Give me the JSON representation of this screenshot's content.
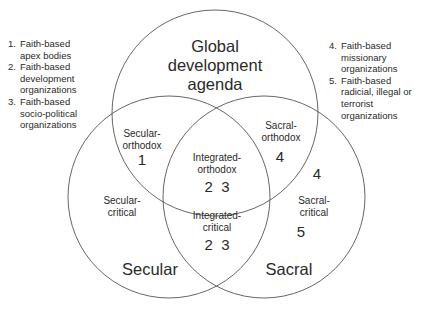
{
  "diagram": {
    "type": "venn",
    "circles": [
      {
        "id": "global",
        "label_lines": [
          "Global",
          "development",
          "agenda"
        ],
        "cx": 215,
        "cy": 113,
        "r": 103
      },
      {
        "id": "secular",
        "label": "Secular",
        "cx": 169,
        "cy": 197,
        "r": 101
      },
      {
        "id": "sacral",
        "label": "Sacral",
        "cx": 264,
        "cy": 197,
        "r": 101
      }
    ],
    "stroke_color": "#555555",
    "regions": {
      "secular_orthodox": {
        "line1": "Secular-",
        "line2": "orthodox",
        "numbers": "1"
      },
      "sacral_orthodox": {
        "line1": "Sacral-",
        "line2": "orthodox",
        "numbers": "4"
      },
      "integrated_orthodox": {
        "line1": "Integrated-",
        "line2": "orthodox",
        "numbers": "2  3"
      },
      "secular_critical": {
        "line1": "Secular-",
        "line2": "critical"
      },
      "integrated_critical": {
        "line1": "Integrated-",
        "line2": "critical",
        "numbers": "2  3"
      },
      "sacral_critical": {
        "line1": "Sacral-",
        "line2": "critical",
        "numbers_above": "4",
        "numbers": "5"
      }
    }
  },
  "legend_left": [
    {
      "num": "1.",
      "lines": [
        "Faith-based",
        "apex bodies"
      ]
    },
    {
      "num": "2.",
      "lines": [
        "Faith-based",
        "development",
        "organizations"
      ]
    },
    {
      "num": "3.",
      "lines": [
        "Faith-based",
        "socio-political",
        "organizations"
      ]
    }
  ],
  "legend_right": [
    {
      "num": "4.",
      "lines": [
        "Faith-based",
        "missionary",
        "organizations"
      ]
    },
    {
      "num": "5.",
      "lines": [
        "Faith-based",
        "radicial, illegal or",
        "terrorist",
        "organizations"
      ]
    }
  ]
}
